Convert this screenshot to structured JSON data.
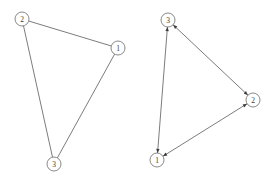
{
  "figure": {
    "type": "diagram",
    "diagram_kind": "graph-pair",
    "background_color": "#ffffff",
    "edge_color": "#5a5a5a",
    "node_fill": "#ffffff",
    "node_stroke": "#6b6b6b",
    "label_color": "#3a3a3a",
    "arrow_color": "#3c3c3c",
    "node_radius": 7,
    "panels": [
      {
        "id": "left-graph",
        "name": "undirected-triangle-graph",
        "directed": false,
        "nodes": [
          {
            "id": "n2",
            "label": "2",
            "x": 22,
            "y": 19
          },
          {
            "id": "n1",
            "label": "1",
            "x": 118,
            "y": 48
          },
          {
            "id": "n3",
            "label": "3",
            "x": 54,
            "y": 164
          }
        ],
        "edges": [
          {
            "from": "n2",
            "to": "n1",
            "arrow_from": false,
            "arrow_to": false
          },
          {
            "from": "n2",
            "to": "n3",
            "arrow_from": false,
            "arrow_to": false
          },
          {
            "from": "n1",
            "to": "n3",
            "arrow_from": false,
            "arrow_to": false
          }
        ]
      },
      {
        "id": "right-graph",
        "name": "bidirected-triangle-graph",
        "directed": true,
        "nodes": [
          {
            "id": "n3",
            "label": "3",
            "x": 168,
            "y": 20
          },
          {
            "id": "n2",
            "label": "2",
            "x": 253,
            "y": 100
          },
          {
            "id": "n1",
            "label": "1",
            "x": 157,
            "y": 160
          }
        ],
        "edges": [
          {
            "from": "n3",
            "to": "n2",
            "arrow_from": true,
            "arrow_to": true
          },
          {
            "from": "n2",
            "to": "n1",
            "arrow_from": true,
            "arrow_to": true
          },
          {
            "from": "n1",
            "to": "n3",
            "arrow_from": true,
            "arrow_to": true
          }
        ]
      }
    ]
  }
}
